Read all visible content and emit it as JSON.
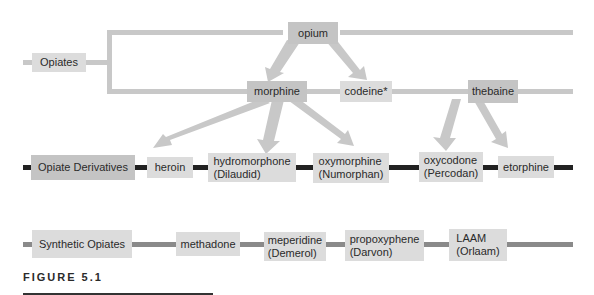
{
  "figure_label": "FIGURE 5.1",
  "colors": {
    "opiate_line": "#c8c8c8",
    "derivative_line": "#222222",
    "synthetic_line": "#8a8a8a",
    "arrow": "#c8c8c8",
    "box_light": "#dcdcdc",
    "box_mid": "#c4c4c4"
  },
  "opiates": {
    "category": "Opiates",
    "opium": "opium",
    "morphine": "morphine",
    "codeine": "codeine*",
    "thebaine": "thebaine"
  },
  "derivatives": {
    "category": "Opiate Derivatives",
    "items": [
      {
        "name": "heroin",
        "brand": ""
      },
      {
        "name": "hydromorphone",
        "brand": "(Dilaudid)"
      },
      {
        "name": "oxymorphine",
        "brand": "(Numorphan)"
      },
      {
        "name": "oxycodone",
        "brand": "(Percodan)"
      },
      {
        "name": "etorphine",
        "brand": ""
      }
    ]
  },
  "synthetics": {
    "category": "Synthetic Opiates",
    "items": [
      {
        "name": "methadone",
        "brand": ""
      },
      {
        "name": "meperidine",
        "brand": "(Demerol)"
      },
      {
        "name": "propoxyphene",
        "brand": "(Darvon)"
      },
      {
        "name": "LAAM",
        "brand": "(Orlaam)"
      }
    ]
  },
  "relationships": [
    {
      "from": "opium",
      "to": "morphine"
    },
    {
      "from": "opium",
      "to": "codeine*"
    },
    {
      "from": "morphine",
      "to": "heroin"
    },
    {
      "from": "morphine",
      "to": "hydromorphone"
    },
    {
      "from": "morphine",
      "to": "oxymorphine"
    },
    {
      "from": "thebaine",
      "to": "oxycodone"
    },
    {
      "from": "thebaine",
      "to": "etorphine"
    }
  ]
}
